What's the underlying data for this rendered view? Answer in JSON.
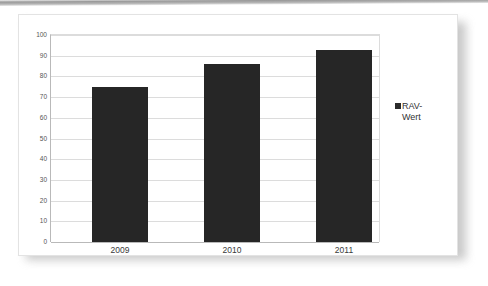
{
  "chart_data": {
    "type": "bar",
    "title": "",
    "subtitle": "",
    "xlabel": "",
    "ylabel": "",
    "categories": [
      "2009",
      "2010",
      "2011"
    ],
    "series": [
      {
        "name": "RAV-Wert",
        "values": [
          75,
          86,
          93
        ],
        "color": "#262626"
      }
    ],
    "ylim": [
      0,
      100
    ],
    "ytick_labels": [
      "100",
      "90",
      "80",
      "70",
      "60",
      "50",
      "40",
      "30",
      "20",
      "10",
      "0"
    ],
    "ytick_values": [
      100,
      90,
      80,
      70,
      60,
      50,
      40,
      30,
      20,
      10,
      0
    ],
    "grid": true,
    "grid_axis": "y",
    "legend": {
      "position": "right",
      "entries": [
        {
          "label": "RAV-\nWert",
          "marker": "square",
          "color": "#2b2b2b"
        }
      ]
    },
    "colors": {
      "bar": "#262626",
      "gridline": "#dcdcdc",
      "axis": "#b9b9b9",
      "tick_text": "#555555",
      "category_text": "#3a3a3a",
      "background": "#ffffff"
    }
  }
}
